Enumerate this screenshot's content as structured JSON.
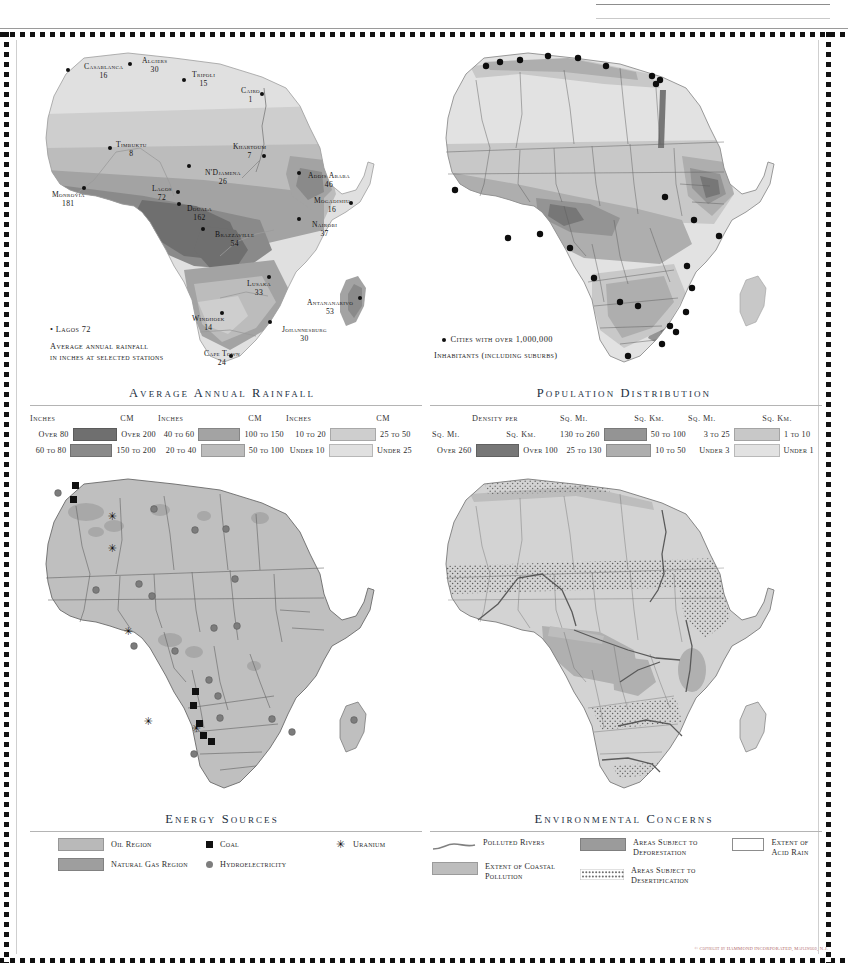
{
  "page": {
    "copyright": "© Copyright by HAMMOND INCORPORATED, Maplewood, N.J."
  },
  "maps": {
    "rainfall": {
      "title": "Average Annual Rainfall",
      "key_sample": "• Lagos 72",
      "key_line1": "Average annual rainfall",
      "key_line2": "in inches at selected stations",
      "cities": [
        {
          "name": "Casablanca",
          "value": "16",
          "x": 60,
          "y": 18,
          "dx": 42,
          "dy": 24
        },
        {
          "name": "Algiers",
          "value": "30",
          "x": 118,
          "y": 12,
          "dx": 104,
          "dy": 18
        },
        {
          "name": "Tripoli",
          "value": "15",
          "x": 168,
          "y": 26,
          "dx": 158,
          "dy": 34
        },
        {
          "name": "Cairo",
          "value": "1",
          "x": 217,
          "y": 42,
          "dx": 236,
          "dy": 48
        },
        {
          "name": "Timbuktu",
          "value": "8",
          "x": 92,
          "y": 96,
          "dx": 84,
          "dy": 102
        },
        {
          "name": "Khartoum",
          "value": "7",
          "x": 209,
          "y": 98,
          "dx": 238,
          "dy": 110
        },
        {
          "name": "N'Djamena",
          "value": "26",
          "x": 181,
          "y": 124,
          "dx": 163,
          "dy": 120
        },
        {
          "name": "Addis Ababa",
          "value": "46",
          "x": 284,
          "y": 127,
          "dx": 273,
          "dy": 127
        },
        {
          "name": "Monrovia",
          "value": "181",
          "x": 28,
          "y": 146,
          "dx": 58,
          "dy": 142
        },
        {
          "name": "Lagos",
          "value": "72",
          "x": 128,
          "y": 140,
          "dx": 152,
          "dy": 146
        },
        {
          "name": "Douala",
          "value": "162",
          "x": 163,
          "y": 160,
          "dx": 153,
          "dy": 158
        },
        {
          "name": "Mogadishu",
          "value": "16",
          "x": 290,
          "y": 152,
          "dx": 325,
          "dy": 157
        },
        {
          "name": "Brazzaville",
          "value": "54",
          "x": 191,
          "y": 186,
          "dx": 177,
          "dy": 183
        },
        {
          "name": "Nairobi",
          "value": "37",
          "x": 288,
          "y": 176,
          "dx": 273,
          "dy": 173
        },
        {
          "name": "Lusaka",
          "value": "33",
          "x": 223,
          "y": 235,
          "dx": 243,
          "dy": 231
        },
        {
          "name": "Antananarivo",
          "value": "53",
          "x": 283,
          "y": 254,
          "dx": 334,
          "dy": 252
        },
        {
          "name": "Windhoek",
          "value": "14",
          "x": 168,
          "y": 270,
          "dx": 196,
          "dy": 267
        },
        {
          "name": "Johannesburg",
          "value": "30",
          "x": 258,
          "y": 281,
          "dx": 244,
          "dy": 276
        },
        {
          "name": "Cape Town",
          "value": "24",
          "x": 180,
          "y": 305,
          "dx": 205,
          "dy": 310
        }
      ],
      "legend": {
        "col_headers": [
          "Inches",
          "CM"
        ],
        "groups": [
          [
            {
              "inches": "Over 80",
              "cm": "Over 200",
              "color": "#6f6f6f"
            },
            {
              "inches": "60 to 80",
              "cm": "150 to 200",
              "color": "#8a8a8a"
            }
          ],
          [
            {
              "inches": "40 to 60",
              "cm": "100 to 150",
              "color": "#a3a3a3"
            },
            {
              "inches": "20 to 40",
              "cm": "50 to 100",
              "color": "#bcbcbc"
            }
          ],
          [
            {
              "inches": "10 to 20",
              "cm": "25 to 50",
              "color": "#cecece"
            },
            {
              "inches": "Under 10",
              "cm": "Under 25",
              "color": "#e0e0e0"
            }
          ]
        ]
      }
    },
    "population": {
      "title": "Population Distribution",
      "key_line1": "Cities with over 1,000,000",
      "key_line2": "Inhabitants (including suburbs)",
      "legend": {
        "density_label": "Density per",
        "col_headers": [
          "Sq. Mi.",
          "Sq. Km."
        ],
        "groups": [
          [
            {
              "mi": "Over 260",
              "km": "Over 100",
              "color": "#777777"
            }
          ],
          [
            {
              "mi": "130 to 260",
              "km": "50 to 100",
              "color": "#949494"
            },
            {
              "mi": "25 to 130",
              "km": "10 to 50",
              "color": "#aeaeae"
            }
          ],
          [
            {
              "mi": "3 to 25",
              "km": "1 to 10",
              "color": "#c8c8c8"
            },
            {
              "mi": "Under 3",
              "km": "Under 1",
              "color": "#e2e2e2"
            }
          ]
        ]
      }
    },
    "energy": {
      "title": "Energy Sources",
      "legend": [
        {
          "label": "Oil Region",
          "symbol": "swatch",
          "color": "#b9b9b9"
        },
        {
          "label": "Natural Gas Region",
          "symbol": "swatch",
          "color": "#9e9e9e"
        },
        {
          "label": "Coal",
          "symbol": "square",
          "color": "#111111"
        },
        {
          "label": "Hydroelectricity",
          "symbol": "circle",
          "color": "#7e7e7e"
        },
        {
          "label": "Uranium",
          "symbol": "asterisk",
          "color": "#111111"
        }
      ]
    },
    "environment": {
      "title": "Environmental Concerns",
      "legend": [
        {
          "label": "Polluted Rivers",
          "symbol": "line",
          "color": "#808080"
        },
        {
          "label": "Extent of Coastal Pollution",
          "symbol": "swatch",
          "color": "#bdbdbd"
        },
        {
          "label": "Areas Subject to Deforestation",
          "symbol": "swatch",
          "color": "#9b9b9b"
        },
        {
          "label": "Areas Subject to Desertification",
          "symbol": "stipple",
          "color": "#6e6e6e"
        },
        {
          "label": "Extent of Acid Rain",
          "symbol": "outline",
          "color": "#ffffff"
        }
      ]
    }
  }
}
